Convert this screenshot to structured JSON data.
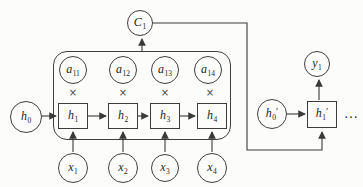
{
  "diagram_title": "sequence-attention-diagram",
  "colors": {
    "line": "#3a3a3a",
    "text": "#1c1c1c",
    "background": "#fcfcfb"
  },
  "symbols": {
    "multiply": "×",
    "ellipsis": "…"
  },
  "nodes": {
    "context": {
      "base": "C",
      "sub": "1"
    },
    "attention": [
      {
        "base": "a",
        "sub": "11"
      },
      {
        "base": "a",
        "sub": "12"
      },
      {
        "base": "a",
        "sub": "13"
      },
      {
        "base": "a",
        "sub": "14"
      }
    ],
    "encoder_initial": {
      "base": "h",
      "sub": "0"
    },
    "encoder_hidden": [
      {
        "base": "h",
        "sub": "1"
      },
      {
        "base": "h",
        "sub": "2"
      },
      {
        "base": "h",
        "sub": "3"
      },
      {
        "base": "h",
        "sub": "4"
      }
    ],
    "inputs": [
      {
        "base": "x",
        "sub": "1"
      },
      {
        "base": "x",
        "sub": "2"
      },
      {
        "base": "x",
        "sub": "3"
      },
      {
        "base": "x",
        "sub": "4"
      }
    ],
    "decoder_initial": {
      "base": "h",
      "sub": "0",
      "prime": "′"
    },
    "decoder_hidden": {
      "base": "h",
      "sub": "1",
      "prime": "′"
    },
    "output": {
      "base": "y",
      "sub": "1"
    }
  }
}
